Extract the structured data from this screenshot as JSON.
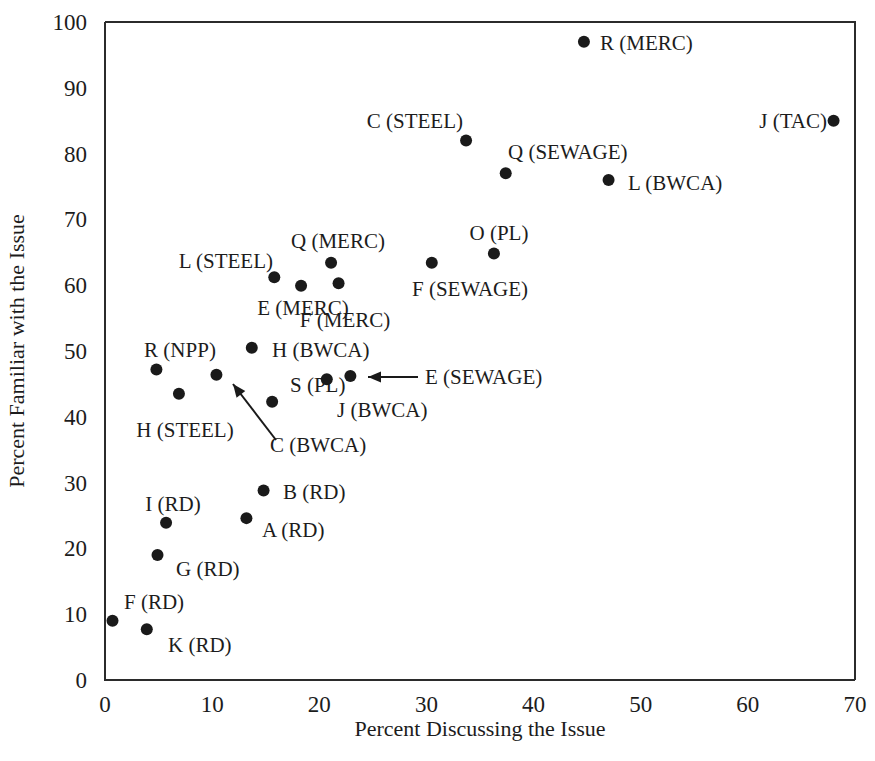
{
  "chart_data": {
    "type": "scatter",
    "title": "",
    "xlabel": "Percent Discussing the Issue",
    "ylabel": "Percent Familiar with the Issue",
    "xlim": [
      0,
      70
    ],
    "ylim": [
      0,
      100
    ],
    "xticks": [
      "0",
      "10",
      "20",
      "30",
      "40",
      "50",
      "60",
      "70"
    ],
    "yticks": [
      "0",
      "10",
      "20",
      "30",
      "40",
      "50",
      "60",
      "70",
      "80",
      "90",
      "100"
    ],
    "grid": false,
    "legend": "none",
    "marker_color": "#1a1a1a",
    "axis_color": "#2b2b2b",
    "points": [
      {
        "label": "R (MERC)",
        "x": 44.7,
        "y": 97.0,
        "lx": 600,
        "ly": 50,
        "anchor": "start"
      },
      {
        "label": "C (STEEL)",
        "x": 33.7,
        "y": 82.0,
        "lx": 463,
        "ly": 128,
        "anchor": "end"
      },
      {
        "label": "J (TAC)",
        "x": 68.0,
        "y": 85.0,
        "lx": 827,
        "ly": 128,
        "anchor": "end"
      },
      {
        "label": "Q (SEWAGE)",
        "x": 37.4,
        "y": 77.0,
        "lx": 508,
        "ly": 159,
        "anchor": "start"
      },
      {
        "label": "L (BWCA)",
        "x": 47.0,
        "y": 76.0,
        "lx": 628,
        "ly": 190,
        "anchor": "start"
      },
      {
        "label": "O (PL)",
        "x": 36.3,
        "y": 64.8,
        "lx": 499,
        "ly": 240,
        "anchor": "middle"
      },
      {
        "label": "Q (MERC)",
        "x": 21.1,
        "y": 63.4,
        "lx": 338,
        "ly": 248,
        "anchor": "middle"
      },
      {
        "label": "L (STEEL)",
        "x": 15.8,
        "y": 61.2,
        "lx": 273,
        "ly": 268,
        "anchor": "end"
      },
      {
        "label": "F (SEWAGE)",
        "x": 30.5,
        "y": 63.4,
        "lx": 470,
        "ly": 296,
        "anchor": "middle"
      },
      {
        "label": "E (MERC)",
        "x": 18.3,
        "y": 59.9,
        "lx": 303,
        "ly": 315,
        "anchor": "middle"
      },
      {
        "label": "F (MERC)",
        "x": 21.8,
        "y": 60.3,
        "lx": 345,
        "ly": 327,
        "anchor": "middle"
      },
      {
        "label": "H (BWCA)",
        "x": 13.7,
        "y": 50.5,
        "lx": 272,
        "ly": 357,
        "anchor": "start"
      },
      {
        "label": "R (NPP)",
        "x": 4.8,
        "y": 47.2,
        "lx": 180,
        "ly": 357,
        "anchor": "middle"
      },
      {
        "label": "E (SEWAGE)",
        "x": 22.9,
        "y": 46.2,
        "lx": 425,
        "ly": 384,
        "anchor": "start"
      },
      {
        "label": "S (PL)",
        "x": 15.6,
        "y": 42.3,
        "lx": 290,
        "ly": 392,
        "anchor": "start"
      },
      {
        "label": "H (STEEL)",
        "x": 6.9,
        "y": 43.5,
        "lx": 185,
        "ly": 437,
        "anchor": "middle"
      },
      {
        "label": "J (BWCA)",
        "x": 20.7,
        "y": 45.7,
        "lx": 337,
        "ly": 417,
        "anchor": "start"
      },
      {
        "label": "C (BWCA)",
        "x": 10.4,
        "y": 46.4,
        "lx": 270,
        "ly": 452,
        "anchor": "start"
      },
      {
        "label": "B (RD)",
        "x": 14.8,
        "y": 28.8,
        "lx": 283,
        "ly": 499,
        "anchor": "start"
      },
      {
        "label": "A (RD)",
        "x": 13.2,
        "y": 24.6,
        "lx": 262,
        "ly": 537,
        "anchor": "start"
      },
      {
        "label": "I (RD)",
        "x": 5.7,
        "y": 23.9,
        "lx": 173,
        "ly": 511,
        "anchor": "middle"
      },
      {
        "label": "G (RD)",
        "x": 4.9,
        "y": 19.0,
        "lx": 176,
        "ly": 576,
        "anchor": "start"
      },
      {
        "label": "F (RD)",
        "x": 0.7,
        "y": 9.0,
        "lx": 124,
        "ly": 609,
        "anchor": "start"
      },
      {
        "label": "K (RD)",
        "x": 3.9,
        "y": 7.7,
        "lx": 168,
        "ly": 652,
        "anchor": "start"
      }
    ],
    "annotations": [
      {
        "name": "e-sewage-arrow",
        "text": "",
        "x1": 418,
        "y1": 377,
        "x2": 368,
        "y2": 377
      },
      {
        "name": "c-bwca-arrow",
        "text": "",
        "x1": 276,
        "y1": 440,
        "x2": 233,
        "y2": 384
      }
    ]
  }
}
